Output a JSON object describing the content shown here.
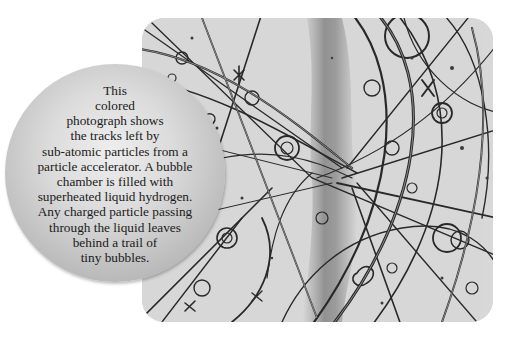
{
  "figure": {
    "photo": {
      "subject": "bubble chamber particle tracks",
      "tone": "grayscale",
      "colors": {
        "background": "#d6d6d6",
        "track": "#2a2a2a",
        "track_highlight": "#f2f2f2",
        "central_smear": "#8a8a8a"
      }
    },
    "caption": {
      "lines": [
        "This",
        "colored",
        "photograph shows",
        "the tracks left by",
        "sub-atomic particles from a",
        "particle accelerator. A bubble",
        "chamber is filled with",
        "superheated liquid hydrogen.",
        "Any charged particle passing",
        "through the liquid leaves",
        "behind a trail of",
        "tiny bubbles."
      ],
      "bubble_colors": {
        "light": "#eeeeee",
        "dark": "#a4a4a4"
      }
    }
  }
}
